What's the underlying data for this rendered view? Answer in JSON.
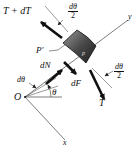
{
  "diagram": {
    "type": "free-body diagram",
    "labels": {
      "tension_top": "T + dT",
      "tension_bottom": "T",
      "normal_force": "dN",
      "friction_force": "dF",
      "point_p": "P'",
      "origin": "O",
      "x_axis": "x",
      "y_axis": "y",
      "angle": "θ",
      "dtheta": "dθ",
      "half_angle_num": "dθ",
      "half_angle_den": "2",
      "element_label": "p"
    },
    "colors": {
      "lines": "#333333",
      "arrows": "#111111",
      "element_fill_dark": "#2a2a2a",
      "element_fill_light": "#8a8a8a"
    }
  }
}
